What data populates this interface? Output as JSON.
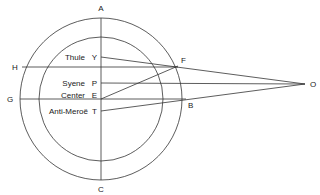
{
  "diagram": {
    "colors": {
      "line": "#333333",
      "text": "#222222",
      "background": "#ffffff"
    },
    "points": {
      "A": "A",
      "C": "C",
      "H": "H",
      "G": "G",
      "F": "F",
      "B": "B",
      "O": "O",
      "Y": "Y",
      "P": "P",
      "E": "E",
      "T": "T"
    },
    "labels": {
      "thule": "Thule",
      "syene": "Syene",
      "center": "Center",
      "anti_meroe": "Anti-Meroë"
    }
  }
}
